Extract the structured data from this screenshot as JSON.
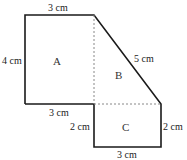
{
  "diagram": {
    "type": "composite-shape",
    "regions": [
      {
        "id": "A",
        "label": "A",
        "shape": "rectangle"
      },
      {
        "id": "B",
        "label": "B",
        "shape": "right-triangle"
      },
      {
        "id": "C",
        "label": "C",
        "shape": "rectangle"
      }
    ],
    "dimensions": {
      "top": "3 cm",
      "left": "4 cm",
      "diagonal": "5 cm",
      "a_bottom": "3 cm",
      "c_left": "2 cm",
      "c_right": "2 cm",
      "c_bottom": "3 cm"
    },
    "colors": {
      "outline": "#1a1a1a",
      "dashed": "#888888",
      "background": "#ffffff"
    }
  }
}
